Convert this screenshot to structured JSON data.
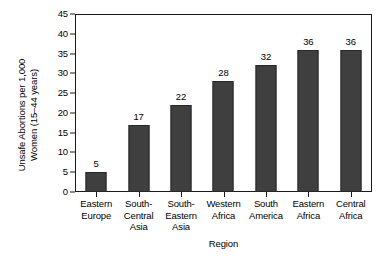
{
  "chart_data": {
    "type": "bar",
    "title": "",
    "subtitle": "",
    "xlabel": "Region",
    "ylabel": "Unsafe Abortions per 1,000 Women (15–44 years)",
    "ylabel_lines": [
      "Unsafe Abortions per 1,000",
      "Women (15–44 years)"
    ],
    "categories": [
      "Eastern Europe",
      "South-Central Asia",
      "South-Eastern Asia",
      "Western Africa",
      "South America",
      "Eastern Africa",
      "Central Africa"
    ],
    "category_label_lines": [
      [
        "Eastern",
        "Europe"
      ],
      [
        "South-",
        "Central",
        "Asia"
      ],
      [
        "South-",
        "Eastern",
        "Asia"
      ],
      [
        "Western",
        "Africa"
      ],
      [
        "South",
        "America"
      ],
      [
        "Eastern",
        "Africa"
      ],
      [
        "Central",
        "Africa"
      ]
    ],
    "values": [
      5,
      17,
      22,
      28,
      32,
      36,
      36
    ],
    "value_labels": [
      "5",
      "17",
      "22",
      "28",
      "32",
      "36",
      "36"
    ],
    "ylim": [
      0,
      45
    ],
    "ytick_values": [
      0,
      5,
      10,
      15,
      20,
      25,
      30,
      35,
      40,
      45
    ],
    "ytick_labels": [
      "0",
      "5",
      "10",
      "15",
      "20",
      "25",
      "30",
      "35",
      "40",
      "45"
    ],
    "grid": false,
    "legend": null,
    "legend_position": "none",
    "bar_color": "#3f3f3f",
    "bar_edge_color": "#262626",
    "axis_color": "#1a1a1a",
    "background_color": "#ffffff"
  }
}
